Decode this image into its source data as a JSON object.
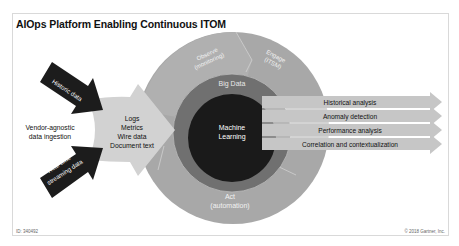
{
  "title": "AIOps Platform Enabling Continuous ITOM",
  "inputs": {
    "historic": "Historic data",
    "realtime_line1": "Real-time",
    "realtime_line2": "streaming data",
    "ingestion_line1": "Vendor-agnostic",
    "ingestion_line2": "data ingestion"
  },
  "data_types": [
    "Logs",
    "Metrics",
    "Wire data",
    "Document text"
  ],
  "outer_ring": {
    "observe_line1": "Observe",
    "observe_line2": "(monitoring)",
    "engage_line1": "Engage",
    "engage_line2": "(ITSM)",
    "act_line1": "Act",
    "act_line2": "(automation)"
  },
  "middle_ring": "Big Data",
  "core_line1": "Machine",
  "core_line2": "Learning",
  "outputs": [
    "Historical analysis",
    "Anomaly detection",
    "Performance analysis",
    "Correlation and contextualization"
  ],
  "footer": {
    "id": "ID: 340492",
    "copyright": "© 2018 Gartner, Inc."
  },
  "colors": {
    "outer_ring": "#a6a6a6",
    "observe_segment": "#a0a0a0",
    "middle_ring": "#6e6e6e",
    "core": "#1a1a1a",
    "input_arrows": "#1c1c1c",
    "output_arrows": "#c4c4c4",
    "ingestion_arrow": "#cfcfcf"
  }
}
